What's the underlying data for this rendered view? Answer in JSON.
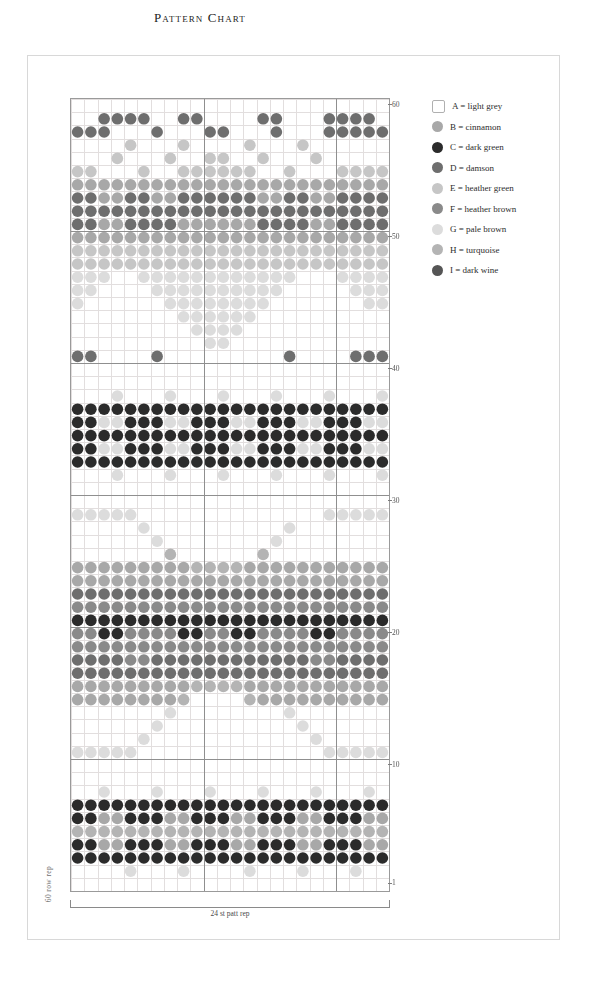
{
  "title": "Pattern Chart",
  "labels": {
    "row_rep": "60 row rep",
    "stitch_rep": "24 st patt rep"
  },
  "grid": {
    "columns": 24,
    "rows": 60,
    "cell_w": 13.25,
    "cell_h": 13.2,
    "grid_line_color": "#e2dede",
    "border_color": "#9a9a9a",
    "repeat_line_color": "#8f8f8f",
    "repeat_divider_cols": [
      10,
      20
    ],
    "heavy_row_lines": [
      10,
      20,
      30,
      40,
      50
    ],
    "row_number_labels": [
      {
        "row": 60,
        "text": "60"
      },
      {
        "row": 50,
        "text": "50"
      },
      {
        "row": 40,
        "text": "40"
      },
      {
        "row": 30,
        "text": "30"
      },
      {
        "row": 20,
        "text": "20"
      },
      {
        "row": 10,
        "text": "10"
      },
      {
        "row": 1,
        "text": "1"
      }
    ]
  },
  "legend": {
    "items": [
      {
        "key": "A",
        "label": "A = light grey",
        "color": "#ffffff",
        "shape": "box"
      },
      {
        "key": "B",
        "label": "B = cinnamon",
        "color": "#a8a8a8",
        "shape": "dot"
      },
      {
        "key": "C",
        "label": "C = dark green",
        "color": "#2b2b2b",
        "shape": "dot"
      },
      {
        "key": "D",
        "label": "D = damson",
        "color": "#6e6e6e",
        "shape": "dot"
      },
      {
        "key": "E",
        "label": "E = heather green",
        "color": "#c6c6c6",
        "shape": "dot"
      },
      {
        "key": "F",
        "label": "F = heather brown",
        "color": "#8a8a8a",
        "shape": "dot"
      },
      {
        "key": "G",
        "label": "G = pale brown",
        "color": "#dcdcdc",
        "shape": "dot"
      },
      {
        "key": "H",
        "label": "H = turquoise",
        "color": "#b4b4b4",
        "shape": "dot"
      },
      {
        "key": "I",
        "label": "I = dark wine",
        "color": "#555555",
        "shape": "dot"
      }
    ]
  },
  "chart_data": {
    "type": "heatmap",
    "title": "Pattern Chart",
    "xlabel": "24 st patt rep",
    "ylabel": "60 row rep",
    "columns": 24,
    "rows": 60,
    "palette": {
      "A": "#ffffff",
      "B": "#a8a8a8",
      "C": "#2b2b2b",
      "D": "#6e6e6e",
      "E": "#c6c6c6",
      "F": "#8a8a8a",
      "G": "#dcdcdc",
      "H": "#b4b4b4",
      "I": "#555555"
    },
    "legend_entries": [
      "A = light grey",
      "B = cinnamon",
      "C = dark green",
      "D = damson",
      "E = heather green",
      "F = heather brown",
      "G = pale brown",
      "H = turquoise",
      "I = dark wine"
    ],
    "grid_rows_bottom_to_top": [
      "AAAAAAAAAAAAAAAAAAAAAAAA",
      "AAAAGAAAGAAAAGAAAGAAAGAA",
      "CCCCCCCCCCCCCCCCCCCCCCCC",
      "CCBBCCCBBCCCBBCCCBBCCCBB",
      "HHHHHHHHHHHHHHHHHHHHHHHH",
      "CCBBCCCBBCCCBBCCCBBCCCBB",
      "CCCCCCCCCCCCCCCCCCCCCCCC",
      "AAGAAAGAAAGAAAGAAAGAAAGA",
      "AAAAAAAAAAAAAAAAAAAAAAAA",
      "AAAAAAAAAAAAAAAAAAAAAAAA",
      "GGGGGAAAAAAAAAAAAAAGGGGG",
      "AAAAAGAAAAAAAAAAAAGAAAAA",
      "AAAAAAGAAAAAAAAAAGAAAAAA",
      "AAAAAAAGAAAAAAAAGAAAAAAA",
      "BBBBBBBBHAAAAHBBBBBBBBBB",
      "BBBBBBBBBHHHHBBBBBBBBBBB",
      "DDDDDDDDDDDDDDDDDDDDDDDD",
      "DDDDFFDDDDDDDDDDDDFFDDDD",
      "FFFFFFFFFFFFFFFFFFFFFFFF",
      "FFCCFFFFCCFFCCFFFFCCFFFF",
      "CCCCCCCCCCCCCCCCCCCCCCCC",
      "FFFFFFFFFFFFFFFFFFFFFFFF",
      "DDDDDDDDDDDDDDDDDDDDDDDD",
      "BBBBBBBBBBBBBBBBBBBBBBBB",
      "BBBBBBBBBHHHHBBBBBBBBBBB",
      "AAAAAAAHAAAAAAHAAAAAAAAA",
      "AAAAAAGAAAAAAAAGAAAAAAAA",
      "AAAAAGAAAAAAAAAAGAAAAAAA",
      "GGGGGAAAAAAAAAAAAAAGGGGG",
      "AAAAAAAAAAAAAAAAAAAAAAAA",
      "AAAAAAAAAAAAAAAAAAAAAAAA",
      "AAAGAAAGAAAGAAAGAAAGAAAG",
      "CCCCCCCCCCCCCCCCCCCCCCCC",
      "CCGGCCCGGCCCGGCCCGGCCCGG",
      "CCCCCCCCCCCCCCCCCCCCCCCC",
      "CCGGCCCGGCCCGGCCCGGCCCGG",
      "CCCCCCCCCCCCCCCCCCCCCCCC",
      "AAAGAAAGAAAGAAAGAAAGAAAG",
      "AAAAAAAAAAAAAAAAAAAAAAAA",
      "AAAAAAAAAAAAAAAAAAAAAAAA",
      "DDAAAADAAAAAAAAADAAAADDD",
      "AAAAAAAAAAGGAAAAAAAAAAAA",
      "AAAAAAAAAGGGGAAAAAAAAAAA",
      "AAAAAAAAGGGGGGAAAAAAAAAA",
      "GAAAAAAGGGGGGGGAAAAAAAGG",
      "GGAAAAGGGGGGGGGGAAAAAGGG",
      "GGGAAGGGGGGGGGGGGAAAGGGG",
      "EEEEEEEEEEEEEEEEEEEEEEEE",
      "EEEEEEEEEEEEEEEEEEEEEEEE",
      "BBBBBBBBBBBBBBBBBBBBBBBB",
      "DDBBDDDDBBBBBBDDDDBBDDDD",
      "DDDDDDDDDDDDDDDDDDDDDDDD",
      "DDBBDDBBDDDDDDBBDDBBDDDD",
      "BBBBBBBBBBBBBBBBBBBBBBBB",
      "EEAAAEAAEEEEEEAAEAAAEEEE",
      "AAAEAAAEAAEEAAEAAAEAAAAA",
      "AAAAEAAAEAAAAEAAAEAAAAAA",
      "DDDAAADAAADDAAADAAADDDDD",
      "AADDDDAADDAAAADDAAADDDDA",
      "AAAAAAAAAAAAAAAAAAAAAAAA"
    ]
  }
}
